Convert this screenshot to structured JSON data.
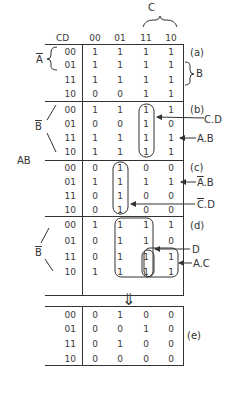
{
  "header": {
    "cd_label": "CD",
    "columns": [
      "00",
      "01",
      "11",
      "10"
    ],
    "c_label": "C",
    "ab_label": "AB"
  },
  "sections": [
    {
      "id": "a",
      "label": "(a)",
      "rows": [
        "00",
        "01",
        "11",
        "10"
      ],
      "cells": [
        [
          "1",
          "1",
          "1",
          "1"
        ],
        [
          "1",
          "1",
          "1",
          "1"
        ],
        [
          "1",
          "1",
          "1",
          "1"
        ],
        [
          "0",
          "0",
          "1",
          "1"
        ]
      ],
      "left_label": "A",
      "left_label_bar": true,
      "right_label": "B",
      "annotations": []
    },
    {
      "id": "b",
      "label": "(b)",
      "rows": [
        "00",
        "01",
        "11",
        "10"
      ],
      "cells": [
        [
          "1",
          "1",
          "1",
          "1"
        ],
        [
          "0",
          "0",
          "1",
          "0"
        ],
        [
          "1",
          "1",
          "1",
          "1"
        ],
        [
          "1",
          "1",
          "1",
          "1"
        ]
      ],
      "left_label": "B",
      "left_label_bar": true,
      "annotations": [
        {
          "text": "C.D"
        },
        {
          "text": "A.B"
        }
      ]
    },
    {
      "id": "c",
      "label": "(c)",
      "rows": [
        "00",
        "01",
        "11",
        "10"
      ],
      "cells": [
        [
          "0",
          "1",
          "0",
          "0"
        ],
        [
          "1",
          "1",
          "1",
          "1"
        ],
        [
          "0",
          "1",
          "0",
          "0"
        ],
        [
          "0",
          "1",
          "0",
          "0"
        ]
      ],
      "annotations": [
        {
          "text": "A.B",
          "bar_first": true
        },
        {
          "text": "C.D",
          "bar_first": true
        }
      ]
    },
    {
      "id": "d",
      "label": "(d)",
      "rows": [
        "00",
        "01",
        "11",
        "10"
      ],
      "cells": [
        [
          "1",
          "1",
          "1",
          "1"
        ],
        [
          "0",
          "1",
          "1",
          "0"
        ],
        [
          "0",
          "1",
          "1",
          "1"
        ],
        [
          "1",
          "1",
          "1",
          "1"
        ]
      ],
      "left_label": "B",
      "left_label_bar": true,
      "annotations": [
        {
          "text": "D"
        },
        {
          "text": "A.C"
        }
      ]
    }
  ],
  "result": {
    "id": "e",
    "label": "(e)",
    "rows": [
      "00",
      "01",
      "11",
      "10"
    ],
    "cells": [
      [
        "0",
        "1",
        "0",
        "0"
      ],
      [
        "0",
        "0",
        "1",
        "0"
      ],
      [
        "0",
        "1",
        "0",
        "0"
      ],
      [
        "0",
        "0",
        "0",
        "0"
      ]
    ],
    "arrow": "⇓"
  }
}
